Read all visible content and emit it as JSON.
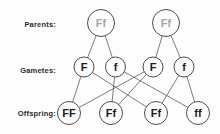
{
  "colors": {
    "background": "#fdfdfd",
    "stroke": "#4d4d4d",
    "line": "#5a5a5a",
    "node_fill": "#fdfdfd",
    "parent_text": "#a6a6a6",
    "node_text": "#1c1c1c",
    "label_text": "#2b2b2b"
  },
  "row_labels": [
    {
      "id": "parents",
      "text": "Parents:"
    },
    {
      "id": "gametes",
      "text": "Gametes:"
    },
    {
      "id": "offspring",
      "text": "Offspring:"
    }
  ],
  "diagram": {
    "nodes": [
      {
        "id": "P1",
        "label": "Ff",
        "row": "parents",
        "x": 101,
        "y": 23,
        "r": 13.5,
        "font_size": 11
      },
      {
        "id": "P2",
        "label": "Ff",
        "row": "parents",
        "x": 166,
        "y": 23,
        "r": 13.5,
        "font_size": 11
      },
      {
        "id": "G1",
        "label": "F",
        "row": "gametes",
        "x": 84,
        "y": 67,
        "r": 10,
        "font_size": 11
      },
      {
        "id": "G2",
        "label": "f",
        "row": "gametes",
        "x": 115.5,
        "y": 67,
        "r": 10,
        "font_size": 11
      },
      {
        "id": "G3",
        "label": "F",
        "row": "gametes",
        "x": 153,
        "y": 67,
        "r": 10,
        "font_size": 11
      },
      {
        "id": "G4",
        "label": "f",
        "row": "gametes",
        "x": 184,
        "y": 67,
        "r": 10,
        "font_size": 11
      },
      {
        "id": "O1",
        "label": "FF",
        "row": "offspring",
        "x": 69,
        "y": 113,
        "r": 11.5,
        "font_size": 11
      },
      {
        "id": "O2",
        "label": "Ff",
        "row": "offspring",
        "x": 111,
        "y": 113,
        "r": 11.5,
        "font_size": 11
      },
      {
        "id": "O3",
        "label": "Ff",
        "row": "offspring",
        "x": 156,
        "y": 113,
        "r": 11.5,
        "font_size": 11
      },
      {
        "id": "O4",
        "label": "ff",
        "row": "offspring",
        "x": 198,
        "y": 113,
        "r": 11.5,
        "font_size": 11
      }
    ],
    "edges": [
      [
        "P1",
        "G1"
      ],
      [
        "P1",
        "G2"
      ],
      [
        "P2",
        "G3"
      ],
      [
        "P2",
        "G4"
      ],
      [
        "G1",
        "O1"
      ],
      [
        "G1",
        "O3"
      ],
      [
        "G2",
        "O2"
      ],
      [
        "G2",
        "O4"
      ],
      [
        "G3",
        "O1"
      ],
      [
        "G3",
        "O2"
      ],
      [
        "G4",
        "O3"
      ],
      [
        "G4",
        "O4"
      ]
    ]
  }
}
